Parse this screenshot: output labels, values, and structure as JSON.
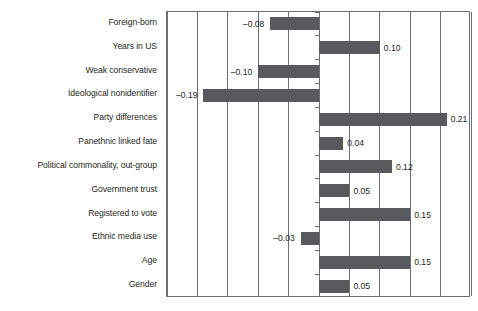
{
  "chart_data": {
    "type": "bar",
    "orientation": "horizontal",
    "title": "",
    "subtitle": "",
    "xlabel": "",
    "ylabel": "",
    "xlim": [
      -0.25,
      0.25
    ],
    "xtick_step": 0.05,
    "xticks": [
      -0.25,
      -0.2,
      -0.15,
      -0.1,
      -0.05,
      0.0,
      0.05,
      0.1,
      0.15,
      0.2,
      0.25
    ],
    "xtick_labels": [],
    "grid": true,
    "legend": false,
    "zero_line": 0.0,
    "bar_color": "#58595b",
    "axis_color": "#6d6e71",
    "text_color": "#231f20",
    "categories": [
      "Foreign-born",
      "Years in US",
      "Weak conservative",
      "Ideological nonidentifier",
      "Party differences",
      "Panethnic linked fate",
      "Political commonality, out-group",
      "Government trust",
      "Registered to vote",
      "Ethnic media use",
      "Age",
      "Gender"
    ],
    "values": [
      -0.08,
      0.1,
      -0.1,
      -0.19,
      0.21,
      0.04,
      0.12,
      0.05,
      0.15,
      -0.03,
      0.15,
      0.05
    ],
    "value_labels": [
      "–0.08",
      "0.10",
      "–0.10",
      "–0.19",
      "0.21",
      "0.04",
      "0.12",
      "0.05",
      "0.15",
      "–0.03",
      "0.15",
      "0.05"
    ]
  }
}
